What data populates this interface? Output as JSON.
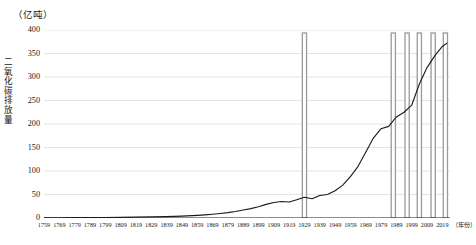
{
  "chart_data": {
    "type": "line",
    "title": "",
    "subtitle": "",
    "unit_caption": "（亿吨）",
    "ylabel": "二氧化碳排放量",
    "xlabel": "（年份）",
    "ylim": [
      0,
      400
    ],
    "yticks": [
      0,
      50,
      100,
      150,
      200,
      250,
      300,
      350,
      400
    ],
    "ytick_labels": [
      "0",
      "50",
      "100",
      "150",
      "200",
      "250",
      "300",
      "350",
      "400"
    ],
    "xlim": [
      1759,
      2024
    ],
    "xticks": [
      1759,
      1769,
      1779,
      1789,
      1799,
      1809,
      1819,
      1829,
      1839,
      1849,
      1859,
      1869,
      1879,
      1889,
      1899,
      1909,
      1919,
      1929,
      1939,
      1949,
      1959,
      1969,
      1979,
      1989,
      1999,
      2009,
      2019
    ],
    "xtick_labels": [
      "1759",
      "1769",
      "1779",
      "1789",
      "1799",
      "1809",
      "1819",
      "1829",
      "1839",
      "1849",
      "1859",
      "1869",
      "1879",
      "1889",
      "1899",
      "1909",
      "1919",
      "1929",
      "1939",
      "1949",
      "1959",
      "1969",
      "1979",
      "1989",
      "1999",
      "2009",
      "2019"
    ],
    "grid": true,
    "grid_color": "#d9d9d9",
    "legend": "none",
    "line_color": "#1a1a1a",
    "highlight_band_color": "#9a9a9a",
    "highlight_bands": [
      1929,
      1987,
      1996,
      2004,
      2013,
      2021
    ],
    "series": [
      {
        "name": "二氧化碳排放量",
        "x": [
          1759,
          1769,
          1779,
          1789,
          1799,
          1809,
          1819,
          1829,
          1839,
          1849,
          1859,
          1864,
          1869,
          1874,
          1879,
          1884,
          1889,
          1894,
          1899,
          1904,
          1909,
          1914,
          1919,
          1924,
          1929,
          1934,
          1939,
          1944,
          1949,
          1954,
          1959,
          1964,
          1969,
          1974,
          1979,
          1984,
          1989,
          1994,
          1999,
          2004,
          2009,
          2014,
          2019,
          2022
        ],
        "values": [
          0.5,
          0.6,
          0.7,
          0.9,
          1.1,
          1.4,
          1.8,
          2.3,
          3.0,
          4.0,
          5.5,
          6.6,
          8.0,
          9.6,
          11.5,
          14.0,
          17.0,
          20.0,
          24.0,
          29.0,
          33.0,
          35.0,
          34.0,
          39.0,
          44.0,
          41.0,
          48.0,
          50.0,
          58.0,
          70.0,
          88.0,
          110.0,
          140.0,
          170.0,
          190.0,
          195.0,
          215.0,
          225.0,
          240.0,
          285.0,
          320.0,
          345.0,
          365.0,
          372.0
        ]
      }
    ]
  }
}
